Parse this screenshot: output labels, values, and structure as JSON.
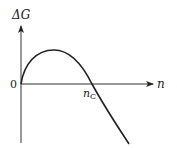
{
  "diagram": {
    "y_axis_label": "ΔG",
    "x_axis_label": "n",
    "origin_label": "0",
    "critical_label_main": "n",
    "critical_label_sub": "C",
    "curve_description": "ΔG rises from 0 to a maximum, then decreases, crossing zero at n_C and continuing negative",
    "colors": {
      "line": "#222222",
      "background": "#ffffff"
    }
  }
}
